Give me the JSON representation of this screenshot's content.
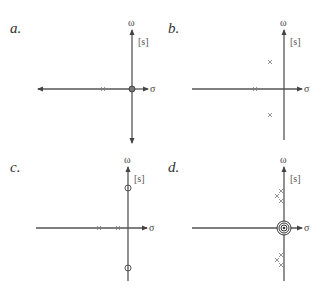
{
  "figure": {
    "axis_labels": {
      "horizontal": "σ",
      "vertical": "ω",
      "plane": "[s]"
    },
    "colors": {
      "axis": "#555555",
      "marker": "#777777",
      "text": "#333333"
    }
  },
  "panels": [
    {
      "label": "a.",
      "poles": [
        {
          "re": -29,
          "im": 0
        }
      ],
      "zeros": [
        {
          "re": 0,
          "im": 0,
          "multiplicity": 1
        }
      ]
    },
    {
      "label": "b.",
      "poles": [
        {
          "re": -29,
          "im": 0
        },
        {
          "re": -14,
          "im": 27
        },
        {
          "re": -14,
          "im": -26
        }
      ],
      "zeros": []
    },
    {
      "label": "c.",
      "poles": [
        {
          "re": -29,
          "im": 0
        },
        {
          "re": -10,
          "im": 0
        }
      ],
      "zeros": [
        {
          "re": 0,
          "im": 40
        },
        {
          "re": 0,
          "im": -40
        }
      ]
    },
    {
      "label": "d.",
      "poles": [
        {
          "re": -3,
          "im": 37
        },
        {
          "re": -7,
          "im": 32
        },
        {
          "re": -3,
          "im": 27
        },
        {
          "re": -3,
          "im": -27
        },
        {
          "re": -7,
          "im": -32
        },
        {
          "re": -3,
          "im": -37
        }
      ],
      "zeros": [
        {
          "re": 0,
          "im": 0,
          "multiplicity": 4
        }
      ]
    }
  ]
}
